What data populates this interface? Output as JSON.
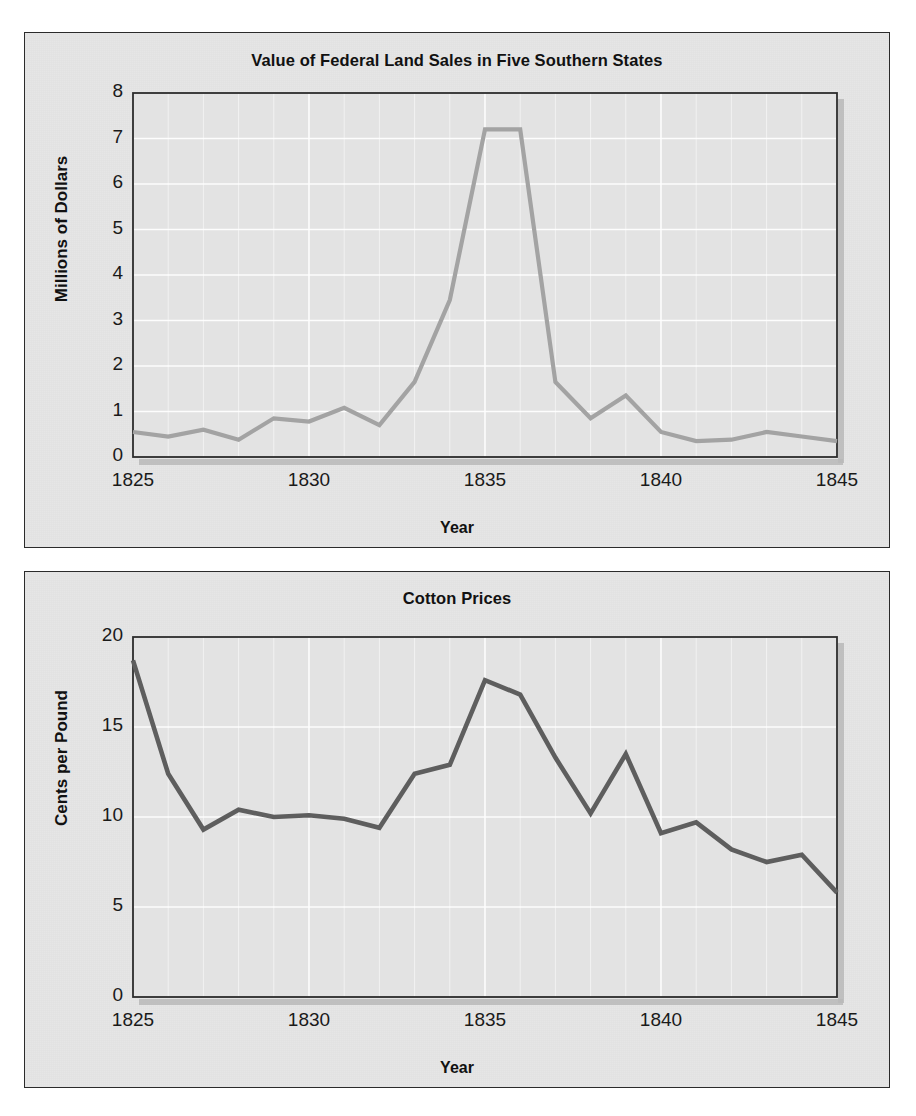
{
  "figure": {
    "background": "#ffffff",
    "panel_background": "#e6e6e6",
    "panel_border": "#2b2b2b"
  },
  "charts": [
    {
      "id": "federal-land-sales",
      "title": "Value of Federal Land Sales in Five Southern States",
      "xlabel": "Year",
      "ylabel": "Millions of Dollars",
      "line_color": "#a3a3a3",
      "grid_color": "#ffffff",
      "yticks": [
        "8",
        "7",
        "6",
        "5",
        "4",
        "3",
        "2",
        "1",
        "0"
      ],
      "xticks": [
        "1825",
        "1830",
        "1835",
        "1840",
        "1845"
      ]
    },
    {
      "id": "cotton-prices",
      "title": "Cotton Prices",
      "xlabel": "Year",
      "ylabel": "Cents per Pound",
      "line_color": "#5e5e5e",
      "grid_color": "#ffffff",
      "yticks": [
        "20",
        "15",
        "10",
        "5",
        "0"
      ],
      "xticks": [
        "1825",
        "1830",
        "1835",
        "1840",
        "1845"
      ]
    }
  ],
  "chart_data": [
    {
      "type": "line",
      "title": "Value of Federal Land Sales in Five Southern States",
      "xlabel": "Year",
      "ylabel": "Millions of Dollars",
      "grid": true,
      "legend": null,
      "xlim": [
        1825,
        1845
      ],
      "ylim": [
        0,
        8
      ],
      "ytick_values": [
        0,
        1,
        2,
        3,
        4,
        5,
        6,
        7,
        8
      ],
      "xtick_values": [
        1825,
        1830,
        1835,
        1840,
        1845
      ],
      "x": [
        1825,
        1826,
        1827,
        1828,
        1829,
        1830,
        1831,
        1832,
        1833,
        1834,
        1835,
        1836,
        1837,
        1838,
        1839,
        1840,
        1841,
        1842,
        1843,
        1844,
        1845
      ],
      "values": [
        0.55,
        0.45,
        0.6,
        0.38,
        0.85,
        0.78,
        1.08,
        0.7,
        1.65,
        3.45,
        7.2,
        7.2,
        1.65,
        0.85,
        1.35,
        0.55,
        0.35,
        0.38,
        0.55,
        0.45,
        0.35
      ],
      "series": [
        {
          "name": "Value of Federal Land Sales",
          "values": [
            0.55,
            0.45,
            0.6,
            0.38,
            0.85,
            0.78,
            1.08,
            0.7,
            1.65,
            3.45,
            7.2,
            7.2,
            1.65,
            0.85,
            1.35,
            0.55,
            0.35,
            0.38,
            0.55,
            0.45,
            0.35
          ]
        }
      ]
    },
    {
      "type": "line",
      "title": "Cotton Prices",
      "xlabel": "Year",
      "ylabel": "Cents per Pound",
      "grid": true,
      "legend": null,
      "xlim": [
        1825,
        1845
      ],
      "ylim": [
        0,
        20
      ],
      "ytick_values": [
        0,
        5,
        10,
        15,
        20
      ],
      "xtick_values": [
        1825,
        1830,
        1835,
        1840,
        1845
      ],
      "x": [
        1825,
        1826,
        1827,
        1828,
        1829,
        1830,
        1831,
        1832,
        1833,
        1834,
        1835,
        1836,
        1837,
        1838,
        1839,
        1840,
        1841,
        1842,
        1843,
        1844,
        1845
      ],
      "values": [
        18.7,
        12.4,
        9.3,
        10.4,
        10.0,
        10.1,
        9.9,
        9.4,
        12.4,
        12.9,
        17.6,
        16.8,
        13.3,
        10.2,
        13.5,
        9.1,
        9.7,
        8.2,
        7.5,
        7.9,
        5.8
      ],
      "series": [
        {
          "name": "Cotton Prices",
          "values": [
            18.7,
            12.4,
            9.3,
            10.4,
            10.0,
            10.1,
            9.9,
            9.4,
            12.4,
            12.9,
            17.6,
            16.8,
            13.3,
            10.2,
            13.5,
            9.1,
            9.7,
            8.2,
            7.5,
            7.9,
            5.8
          ]
        }
      ]
    }
  ]
}
